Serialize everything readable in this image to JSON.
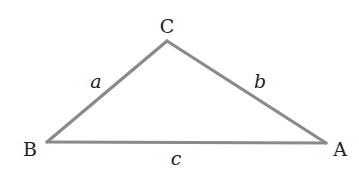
{
  "diagram": {
    "type": "triangle",
    "vertices": [
      {
        "id": "C",
        "label": "C"
      },
      {
        "id": "B",
        "label": "B"
      },
      {
        "id": "A",
        "label": "A"
      }
    ],
    "sides": [
      {
        "id": "a",
        "label": "a",
        "from": "B",
        "to": "C"
      },
      {
        "id": "b",
        "label": "b",
        "from": "C",
        "to": "A"
      },
      {
        "id": "c",
        "label": "c",
        "from": "B",
        "to": "A"
      }
    ],
    "colors": {
      "edge": "#8a8a8a",
      "text": "#222222",
      "background": "#ffffff"
    }
  }
}
